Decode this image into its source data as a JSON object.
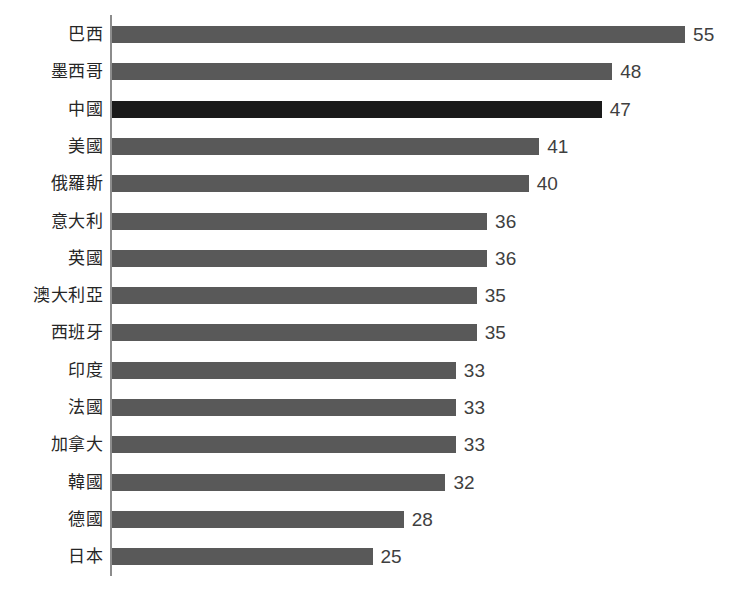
{
  "chart_data": {
    "type": "bar",
    "orientation": "horizontal",
    "title": "",
    "subtitle": "",
    "xlabel": "",
    "ylabel": "",
    "xlim": [
      0,
      60
    ],
    "grid": false,
    "legend": null,
    "data_labels": true,
    "colors": {
      "background": "#ffffff",
      "bar": "#595959",
      "bar_highlight": "#1a1a1a",
      "axis_line": "#8c8c8c",
      "category_label": "#262626",
      "value_label": "#3f3f3f"
    },
    "highlight_category": "中國",
    "categories": [
      "巴西",
      "墨西哥",
      "中國",
      "美國",
      "俄羅斯",
      "意大利",
      "英國",
      "澳大利亞",
      "西班牙",
      "印度",
      "法國",
      "加拿大",
      "韓國",
      "德國",
      "日本"
    ],
    "values": [
      55,
      48,
      47,
      41,
      40,
      36,
      36,
      35,
      35,
      33,
      33,
      33,
      32,
      28,
      25
    ],
    "bars": [
      {
        "category": "巴西",
        "value": 55,
        "label": "55",
        "highlight": false
      },
      {
        "category": "墨西哥",
        "value": 48,
        "label": "48",
        "highlight": false
      },
      {
        "category": "中國",
        "value": 47,
        "label": "47",
        "highlight": true
      },
      {
        "category": "美國",
        "value": 41,
        "label": "41",
        "highlight": false
      },
      {
        "category": "俄羅斯",
        "value": 40,
        "label": "40",
        "highlight": false
      },
      {
        "category": "意大利",
        "value": 36,
        "label": "36",
        "highlight": false
      },
      {
        "category": "英國",
        "value": 36,
        "label": "36",
        "highlight": false
      },
      {
        "category": "澳大利亞",
        "value": 35,
        "label": "35",
        "highlight": false
      },
      {
        "category": "西班牙",
        "value": 35,
        "label": "35",
        "highlight": false
      },
      {
        "category": "印度",
        "value": 33,
        "label": "33",
        "highlight": false
      },
      {
        "category": "法國",
        "value": 33,
        "label": "33",
        "highlight": false
      },
      {
        "category": "加拿大",
        "value": 33,
        "label": "33",
        "highlight": false
      },
      {
        "category": "韓國",
        "value": 32,
        "label": "32",
        "highlight": false
      },
      {
        "category": "德國",
        "value": 28,
        "label": "28",
        "highlight": false
      },
      {
        "category": "日本",
        "value": 25,
        "label": "25",
        "highlight": false
      }
    ]
  },
  "layout": {
    "axis_x": 111,
    "axis_top": 15,
    "axis_bottom": 576,
    "row_pitch": 37.3,
    "first_row_top": 16,
    "px_per_unit": 10.42,
    "value_label_gap": 8
  }
}
